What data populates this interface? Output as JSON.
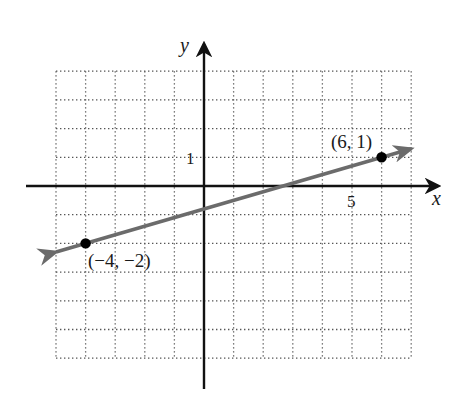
{
  "chart_data": {
    "type": "line",
    "title": "",
    "xlabel": "x",
    "ylabel": "y",
    "xlim": [
      -5,
      7
    ],
    "ylim": [
      -6,
      4
    ],
    "grid": true,
    "grid_style": "dotted",
    "tick_labels": [
      {
        "axis": "x",
        "value": 5,
        "label": "5"
      },
      {
        "axis": "y",
        "value": 1,
        "label": "1"
      }
    ],
    "series": [
      {
        "name": "line through (-4,-2) and (6,1)",
        "color": "#6b6b6b",
        "arrows": "both",
        "x": [
          -5,
          7
        ],
        "y": [
          -2.3,
          1.3
        ]
      }
    ],
    "points": [
      {
        "x": -4,
        "y": -2,
        "label": "(−4, −2)"
      },
      {
        "x": 6,
        "y": 1,
        "label": "(6, 1)"
      }
    ]
  },
  "labels": {
    "x_axis": "x",
    "y_axis": "y",
    "x_tick_5": "5",
    "y_tick_1": "1",
    "point_a": "(−4, −2)",
    "point_b": "(6, 1)"
  },
  "colors": {
    "axis": "#111111",
    "grid": "#555555",
    "line": "#6b6b6b",
    "point": "#000000"
  }
}
